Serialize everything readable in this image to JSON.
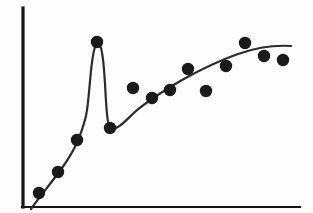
{
  "figure": {
    "title": "",
    "background_color": "#fdfdfd",
    "ink_color": "#151515",
    "curve_color": "#2b2b2b",
    "point_color": "#1a1a1a",
    "width": 313,
    "height": 213
  },
  "axes": {
    "y_axis": {
      "name": "y-axis",
      "x": 23,
      "y_top": 8,
      "y_bottom": 207,
      "stroke_width": 3.2
    },
    "x_axis": {
      "name": "x-axis",
      "y": 207,
      "x_left": 23,
      "x_right": 300,
      "stroke_width": 2.2
    },
    "x_tick_labels": [],
    "y_tick_labels": [],
    "xlabel": "",
    "ylabel": "",
    "grid": "off"
  },
  "chart_data": {
    "type": "scatter",
    "title": "",
    "subtitle": "",
    "xlabel": "",
    "ylabel": "",
    "xlim": [
      23,
      300
    ],
    "ylim": [
      207,
      8
    ],
    "grid": false,
    "legend": "none",
    "annotations": [],
    "axis_note": "Unlabeled axes; values are pixel coordinates read off the figure (y increases downward in pixel space).",
    "points_px": [
      {
        "label": "p1",
        "x": 39,
        "y": 193
      },
      {
        "label": "p2",
        "x": 58,
        "y": 172
      },
      {
        "label": "p3",
        "x": 77,
        "y": 140
      },
      {
        "label": "p4",
        "x": 97,
        "y": 42
      },
      {
        "label": "p5",
        "x": 110,
        "y": 128
      },
      {
        "label": "p6",
        "x": 133,
        "y": 88
      },
      {
        "label": "p7",
        "x": 152,
        "y": 98
      },
      {
        "label": "p8",
        "x": 170,
        "y": 90
      },
      {
        "label": "p9",
        "x": 188,
        "y": 69
      },
      {
        "label": "p10",
        "x": 206,
        "y": 91
      },
      {
        "label": "p11",
        "x": 226,
        "y": 66
      },
      {
        "label": "p12",
        "x": 245,
        "y": 43
      },
      {
        "label": "p13",
        "x": 264,
        "y": 56
      },
      {
        "label": "p14",
        "x": 283,
        "y": 60
      }
    ],
    "point_radius_px": 6.2,
    "x": [
      39,
      58,
      77,
      97,
      110,
      133,
      152,
      170,
      188,
      206,
      226,
      245,
      264,
      283
    ],
    "y": [
      193,
      172,
      140,
      42,
      128,
      88,
      98,
      90,
      69,
      91,
      66,
      43,
      56,
      60
    ],
    "fit_curve": {
      "name": "overfitting-curve",
      "description": "Smooth rising trend that makes a sharp narrow spike to reach the outlier near x=97 then drops back down and continues rising with flattening tail.",
      "stroke_width": 2.2,
      "path": "M 31 209 C 40 196, 52 182, 62 168 C 72 154, 80 140, 86 116 C 90 96, 90 62, 95 47 C 96 43, 99 43, 101 48 C 105 62, 105 95, 107 114 C 108 124, 109 128, 111 129 C 118 130, 126 120, 136 111 C 150 99, 165 90, 182 80 C 200 70, 218 61, 238 54 C 255 48, 275 45, 291 46"
    }
  },
  "accessibility": {
    "alt_text": "Scatter plot with an overfitted curve that spikes through a single high outlier."
  }
}
